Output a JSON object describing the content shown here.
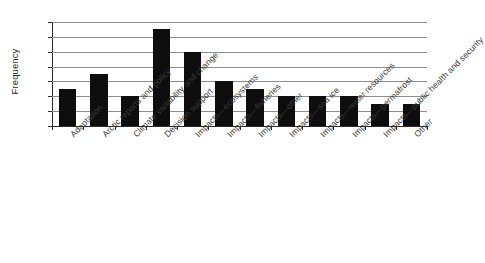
{
  "chart_data": {
    "type": "bar",
    "title": "",
    "xlabel": "",
    "ylabel": "Frequency",
    "categories": [
      "Adaptation",
      "Arctic reports and policy",
      "Climate variability and change",
      "Decision support",
      "Impacts—ecosystems",
      "Impacts—fisheries",
      "Impacts—other",
      "Impacts—sea ice",
      "Impacts—water resources",
      "Impacts—permafrost",
      "Impacts—public health and security",
      "Other"
    ],
    "values": [
      5,
      7,
      4,
      13,
      10,
      6,
      5,
      4,
      4,
      4,
      3,
      3
    ],
    "ylim": [
      0,
      14
    ],
    "yticks": [
      0,
      2,
      4,
      6,
      8,
      10,
      12,
      14
    ],
    "ytick_labels": [
      "0",
      "2",
      "4",
      "6",
      "8",
      "10",
      "12",
      "14"
    ],
    "grid": "horizontal",
    "legend": "none",
    "bar_color": "#0d0d0d",
    "background_color": "#ffffff",
    "gridline_color": "#8d8d8d",
    "axis_color": "#2a2a2a",
    "label_rotation_degrees": -45
  }
}
